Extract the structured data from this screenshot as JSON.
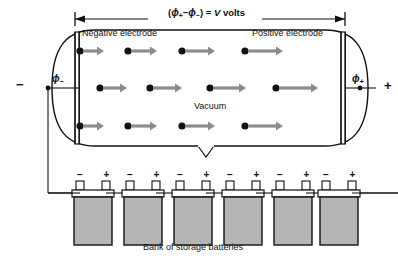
{
  "figure": {
    "type": "physics-diagram",
    "background_color": "#ffffff",
    "line_color": "#111111",
    "arrow_color": "#8c8c8c",
    "electron_color": "#111111",
    "battery_fill_color": "#b5b5b5",
    "battery_top_color": "#ffffff"
  },
  "dimension": {
    "label_full": "(ϕ₊ − ϕ₋) = V volts",
    "open_paren": "(",
    "phi_plus": "ϕ",
    "phi_plus_sub": "+",
    "minus_op": "−",
    "phi_minus": "ϕ",
    "phi_minus_sub": "−",
    "close_paren": ")",
    "equals": "=",
    "v_symbol": "V",
    "units": "volts",
    "start_x": 75,
    "end_x": 345
  },
  "tube": {
    "negative_electrode_label": "Negative electrode",
    "positive_electrode_label": "Positive electrode",
    "interior_label": "Vacuum",
    "left_terminal_sign": "−",
    "right_terminal_sign": "+",
    "left_potential": "ϕ",
    "left_potential_sub": "−",
    "right_potential": "ϕ",
    "right_potential_sub": "+"
  },
  "electron_rows": [
    {
      "row": 1,
      "y": 51,
      "electrons": [
        {
          "dot_x": 80,
          "arrow_start": 84,
          "arrow_end": 104
        },
        {
          "dot_x": 128,
          "arrow_start": 132,
          "arrow_end": 157
        },
        {
          "dot_x": 182,
          "arrow_start": 186,
          "arrow_end": 215
        },
        {
          "dot_x": 245,
          "arrow_start": 249,
          "arrow_end": 283
        }
      ]
    },
    {
      "row": 2,
      "y": 88,
      "electrons": [
        {
          "dot_x": 100,
          "arrow_start": 104,
          "arrow_end": 127
        },
        {
          "dot_x": 150,
          "arrow_start": 154,
          "arrow_end": 182
        },
        {
          "dot_x": 210,
          "arrow_start": 214,
          "arrow_end": 246
        },
        {
          "dot_x": 276,
          "arrow_start": 280,
          "arrow_end": 318
        }
      ]
    },
    {
      "row": 3,
      "y": 126,
      "electrons": [
        {
          "dot_x": 80,
          "arrow_start": 84,
          "arrow_end": 104
        },
        {
          "dot_x": 128,
          "arrow_start": 132,
          "arrow_end": 157
        },
        {
          "dot_x": 182,
          "arrow_start": 186,
          "arrow_end": 215
        },
        {
          "dot_x": 245,
          "arrow_start": 249,
          "arrow_end": 283
        }
      ]
    }
  ],
  "battery_bank": {
    "caption": "Bank of storage batteries",
    "count": 6,
    "negative_terminal_sign": "−",
    "positive_terminal_sign": "+",
    "batteries": [
      {
        "index": 1,
        "x": 72
      },
      {
        "index": 2,
        "x": 122
      },
      {
        "index": 3,
        "x": 172
      },
      {
        "index": 4,
        "x": 222
      },
      {
        "index": 5,
        "x": 272
      },
      {
        "index": 6,
        "x": 318
      }
    ]
  }
}
